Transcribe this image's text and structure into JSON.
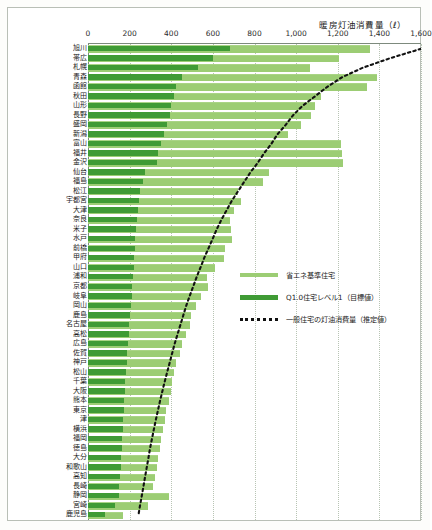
{
  "chart_data": {
    "type": "bar",
    "title": "暖房灯油消費量（ℓ）",
    "xlabel": "暖房灯油消費量（ℓ）",
    "ylabel": "",
    "xlim": [
      0,
      1600
    ],
    "xticks": [
      "0",
      "200",
      "400",
      "600",
      "800",
      "1,000",
      "1,200",
      "1,400",
      "1,600"
    ],
    "xtick_values": [
      0,
      200,
      400,
      600,
      800,
      1000,
      1200,
      1400,
      1600
    ],
    "grid": true,
    "orientation": "horizontal",
    "legend_position": "center-right",
    "legend": [
      {
        "label": "省エネ基準住宅",
        "color": "#9ccd74",
        "style": "bar"
      },
      {
        "label": "Q1.0住宅レベル1（目標値）",
        "color": "#3f9b35",
        "style": "bar"
      },
      {
        "label": "一般住宅の灯油消費量（推定値）",
        "color": "#111111",
        "style": "dotted-line"
      }
    ],
    "categories": [
      "旭川",
      "帯広",
      "札幌",
      "青森",
      "函館",
      "秋田",
      "山形",
      "長野",
      "盛岡",
      "新潟",
      "富山",
      "福井",
      "金沢",
      "仙台",
      "福島",
      "松江",
      "宇都宮",
      "大津",
      "奈良",
      "米子",
      "水戸",
      "前橋",
      "甲府",
      "山口",
      "浦和",
      "京都",
      "岐阜",
      "岡山",
      "鹿島",
      "名古屋",
      "高松",
      "広島",
      "佐賀",
      "神戸",
      "松山",
      "千葉",
      "大阪",
      "熊本",
      "東京",
      "津",
      "横浜",
      "福岡",
      "徳島",
      "大分",
      "和歌山",
      "高知",
      "長崎",
      "静岡",
      "宮崎",
      "鹿児島"
    ],
    "series": [
      {
        "name": "省エネ基準住宅",
        "color": "#9ccd74",
        "values": [
          1355,
          1205,
          1065,
          1390,
          1340,
          1120,
          1090,
          1070,
          1025,
          960,
          1215,
          1220,
          1225,
          870,
          840,
          720,
          735,
          700,
          680,
          685,
          690,
          660,
          655,
          610,
          570,
          575,
          545,
          520,
          495,
          490,
          470,
          450,
          440,
          425,
          415,
          405,
          400,
          390,
          375,
          370,
          360,
          350,
          345,
          335,
          330,
          320,
          310,
          390,
          290,
          170
        ]
      },
      {
        "name": "Q1.0住宅レベル1（目標値）",
        "color": "#3f9b35",
        "values": [
          680,
          600,
          530,
          450,
          425,
          415,
          400,
          395,
          380,
          365,
          350,
          335,
          330,
          275,
          265,
          250,
          245,
          240,
          235,
          230,
          228,
          225,
          222,
          220,
          215,
          212,
          210,
          205,
          200,
          198,
          195,
          190,
          188,
          185,
          182,
          180,
          178,
          175,
          172,
          170,
          168,
          165,
          162,
          160,
          158,
          155,
          150,
          148,
          130,
          80
        ]
      }
    ],
    "estimate_line": {
      "name": "一般住宅の灯油消費量（推定値）",
      "color": "#111111",
      "style": "dotted",
      "note": "descending dotted curve from upper right to lower left across the rows",
      "points": [
        [
          1600,
          0
        ],
        [
          1450,
          1
        ],
        [
          1320,
          2
        ],
        [
          1220,
          3
        ],
        [
          1150,
          4
        ],
        [
          1090,
          5
        ],
        [
          1030,
          6
        ],
        [
          985,
          7
        ],
        [
          950,
          8
        ],
        [
          910,
          9
        ],
        [
          880,
          10
        ],
        [
          845,
          11
        ],
        [
          815,
          12
        ],
        [
          780,
          13
        ],
        [
          750,
          14
        ],
        [
          720,
          15
        ],
        [
          690,
          16
        ],
        [
          665,
          17
        ],
        [
          640,
          18
        ],
        [
          618,
          19
        ],
        [
          598,
          20
        ],
        [
          578,
          21
        ],
        [
          558,
          22
        ],
        [
          540,
          23
        ],
        [
          522,
          24
        ],
        [
          505,
          25
        ],
        [
          488,
          26
        ],
        [
          472,
          27
        ],
        [
          458,
          28
        ],
        [
          444,
          29
        ],
        [
          430,
          30
        ],
        [
          416,
          31
        ],
        [
          404,
          32
        ],
        [
          392,
          33
        ],
        [
          380,
          34
        ],
        [
          368,
          35
        ],
        [
          357,
          36
        ],
        [
          346,
          37
        ],
        [
          336,
          38
        ],
        [
          326,
          39
        ],
        [
          316,
          40
        ],
        [
          307,
          41
        ],
        [
          298,
          42
        ],
        [
          290,
          43
        ],
        [
          282,
          44
        ],
        [
          274,
          45
        ],
        [
          266,
          46
        ],
        [
          258,
          47
        ],
        [
          250,
          48
        ],
        [
          242,
          49
        ]
      ]
    }
  }
}
